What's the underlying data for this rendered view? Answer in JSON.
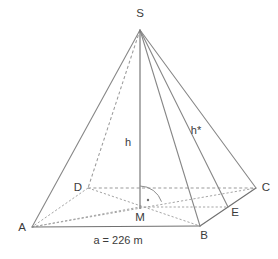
{
  "figure": {
    "kind": "square-pyramid-geometry-diagram",
    "background_color": "#ffffff",
    "line_color": "#878787",
    "hidden_line_color": "#9a9a9a",
    "label_color": "#3b3b3b",
    "vertices": [
      {
        "id": "S",
        "label": "S",
        "x": 140,
        "y": 30,
        "label_x": 140,
        "label_y": 17,
        "label_anchor": "middle"
      },
      {
        "id": "A",
        "label": "A",
        "x": 32,
        "y": 227,
        "label_x": 22,
        "label_y": 231,
        "label_anchor": "middle"
      },
      {
        "id": "B",
        "label": "B",
        "x": 200,
        "y": 226,
        "label_x": 204,
        "label_y": 239,
        "label_anchor": "middle"
      },
      {
        "id": "C",
        "label": "C",
        "x": 256,
        "y": 188,
        "label_x": 266,
        "label_y": 191,
        "label_anchor": "middle"
      },
      {
        "id": "D",
        "label": "D",
        "x": 88,
        "y": 188,
        "label_x": 78,
        "label_y": 191,
        "label_anchor": "middle"
      },
      {
        "id": "M",
        "label": "M",
        "x": 140,
        "y": 209,
        "label_x": 140,
        "label_y": 221,
        "label_anchor": "middle"
      },
      {
        "id": "E",
        "label": "E",
        "x": 228,
        "y": 207,
        "label_x": 235,
        "label_y": 216,
        "label_anchor": "middle"
      }
    ],
    "segments": {
      "height_label": "h",
      "height_label_x": 128,
      "height_label_y": 146,
      "slant_label": "h*",
      "slant_label_x": 196,
      "slant_label_y": 134
    },
    "measurement": {
      "base_edge_label": "a = 226 m",
      "base_edge_label_x": 118,
      "base_edge_label_y": 244,
      "value": 226,
      "unit": "m",
      "symbol": "a"
    }
  }
}
